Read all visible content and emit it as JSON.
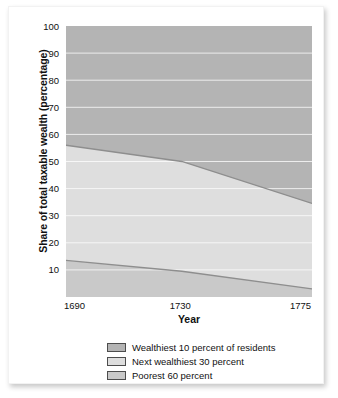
{
  "chart_data": {
    "type": "area",
    "title": "",
    "subtitle": "",
    "xlabel": "Year",
    "ylabel": "Share of total taxable wealth (percentage)",
    "xlim": [
      1690,
      1775
    ],
    "ylim": [
      0,
      100
    ],
    "xticks": [
      1690,
      1730,
      1775
    ],
    "xtick_labels": [
      "1690",
      "1730",
      "1775"
    ],
    "yticks": [
      10,
      20,
      30,
      40,
      50,
      60,
      70,
      80,
      90,
      100
    ],
    "ytick_labels": [
      "10",
      "20",
      "30",
      "40",
      "50",
      "60",
      "70",
      "80",
      "90",
      "100"
    ],
    "grid": "horizontal-white",
    "stacked": true,
    "legend_position": "bottom-center",
    "x": [
      1690,
      1730,
      1775
    ],
    "series": [
      {
        "name": "Poorest 60 percent",
        "color": "#c9c9c9",
        "values": [
          13.5,
          9.5,
          3.0
        ],
        "cumulative_top": [
          13.5,
          9.5,
          3.0
        ]
      },
      {
        "name": "Next wealthiest 30 percent",
        "color": "#dedede",
        "values": [
          42.5,
          40.5,
          31.5
        ],
        "cumulative_top": [
          56.0,
          50.0,
          34.5
        ]
      },
      {
        "name": "Wealthiest 10 percent of residents",
        "color": "#b4b4b4",
        "values": [
          44.0,
          50.0,
          65.5
        ],
        "cumulative_top": [
          100.0,
          100.0,
          100.0
        ]
      }
    ],
    "boundary_upper": {
      "label": "top of Next wealthiest 30 percent band",
      "points": [
        [
          1690,
          56.0
        ],
        [
          1730,
          50.0
        ],
        [
          1775,
          34.5
        ]
      ]
    },
    "boundary_lower": {
      "label": "top of Poorest 60 percent band",
      "points": [
        [
          1690,
          13.5
        ],
        [
          1730,
          9.5
        ],
        [
          1775,
          3.0
        ]
      ]
    }
  },
  "legend": {
    "items": [
      {
        "label": "Wealthiest 10 percent of residents",
        "color": "#b4b4b4"
      },
      {
        "label": "Next wealthiest 30 percent",
        "color": "#dedede"
      },
      {
        "label": "Poorest 60 percent",
        "color": "#c9c9c9"
      }
    ]
  },
  "colors": {
    "band_top": "#b4b4b4",
    "band_middle": "#dedede",
    "band_bottom": "#c9c9c9",
    "gridline": "#ffffff",
    "boundary_line": "#8e8e8e",
    "text": "#111111",
    "card_background": "#ffffff"
  }
}
